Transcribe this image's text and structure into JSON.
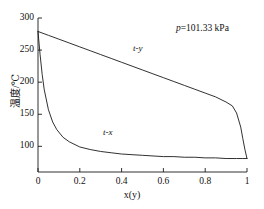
{
  "chart_data": {
    "type": "line",
    "title": "",
    "xlabel": "x(y)",
    "ylabel": "温度/℃",
    "xlim": [
      0,
      1
    ],
    "ylim": [
      60,
      300
    ],
    "grid": false,
    "legend": "inline-labels",
    "annotations": [
      {
        "name": "pressure",
        "text_symbol": "p",
        "text_rest": "=101.33 kPa",
        "x": 0.68,
        "y": 285
      }
    ],
    "xticks": [
      "0",
      "0.2",
      "0.4",
      "0.6",
      "0.8",
      "1"
    ],
    "xtick_values": [
      0,
      0.2,
      0.4,
      0.6,
      0.8,
      1
    ],
    "yticks": [
      "100",
      "150",
      "200",
      "250",
      "300"
    ],
    "ytick_values": [
      100,
      150,
      200,
      250,
      300
    ],
    "series": [
      {
        "name": "t-y",
        "label": "t-y",
        "label_x": 0.46,
        "label_y": 238,
        "x": [
          0.0,
          0.05,
          0.1,
          0.15,
          0.2,
          0.25,
          0.3,
          0.35,
          0.4,
          0.45,
          0.5,
          0.55,
          0.6,
          0.65,
          0.7,
          0.75,
          0.8,
          0.85,
          0.9,
          0.93,
          0.95,
          0.97,
          0.98,
          0.99,
          1.0
        ],
        "y": [
          279,
          273,
          267,
          261,
          255,
          249,
          243,
          237,
          231,
          225,
          219,
          213,
          207,
          201,
          195,
          189,
          183,
          177,
          169,
          163,
          152,
          130,
          112,
          95,
          81
        ]
      },
      {
        "name": "t-x",
        "label": "t-x",
        "label_x": 0.31,
        "label_y": 103,
        "x": [
          0.0,
          0.01,
          0.02,
          0.03,
          0.05,
          0.07,
          0.09,
          0.12,
          0.15,
          0.2,
          0.25,
          0.3,
          0.35,
          0.4,
          0.45,
          0.5,
          0.55,
          0.6,
          0.65,
          0.7,
          0.75,
          0.8,
          0.85,
          0.9,
          0.95,
          0.98,
          1.0
        ],
        "y": [
          279,
          243,
          212,
          188,
          157,
          138,
          126,
          114,
          107,
          99,
          95,
          92,
          90,
          88,
          87,
          86,
          85,
          84,
          84,
          83,
          83,
          82,
          82,
          81,
          81,
          81,
          81
        ]
      }
    ]
  },
  "axes": {
    "origin_label": "0"
  }
}
